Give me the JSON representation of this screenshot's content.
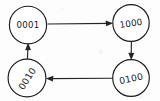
{
  "diagram": {
    "kind": "state-transition-cycle",
    "title": "",
    "background_color": "#fdfdfd",
    "ink_color": "#1b1b1b",
    "style": "hand-drawn",
    "nodes": [
      {
        "id": "n1",
        "label": "0001",
        "position": "top-left",
        "cx": 28,
        "cy": 25,
        "r": 19,
        "rotation_deg": 0
      },
      {
        "id": "n2",
        "label": "1000",
        "position": "top-right",
        "cx": 131,
        "cy": 23,
        "r": 18,
        "rotation_deg": -8
      },
      {
        "id": "n3",
        "label": "0010",
        "position": "bottom-left",
        "cx": 27,
        "cy": 78,
        "r": 19,
        "rotation_deg": -58
      },
      {
        "id": "n4",
        "label": "0100",
        "position": "bottom-right",
        "cx": 131,
        "cy": 78,
        "r": 18,
        "rotation_deg": -12
      }
    ],
    "edges": [
      {
        "id": "e1",
        "from": "0001",
        "to": "1000",
        "direction": "right",
        "label": ""
      },
      {
        "id": "e2",
        "from": "1000",
        "to": "0100",
        "direction": "down",
        "label": ""
      },
      {
        "id": "e3",
        "from": "0100",
        "to": "0010",
        "direction": "left",
        "label": ""
      },
      {
        "id": "e4",
        "from": "0010",
        "to": "0001",
        "direction": "up",
        "label": ""
      }
    ]
  }
}
